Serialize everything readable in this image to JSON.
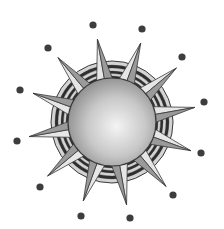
{
  "illustration": {
    "subject": "sun",
    "description": "Grayscale sun with shaded sphere, 12 triangular rays, concentric striped ring and 12 surrounding dots",
    "ray_count": 12,
    "dot_count": 12,
    "colors": {
      "background": "#ffffff",
      "sphere_highlight": "#f4f4f4",
      "sphere_mid": "#c8c8c8",
      "sphere_shadow": "#8a8a8a",
      "outline": "#3a3a3a",
      "ray_light": "#e6e6e6",
      "ray_dark": "#9a9a9a",
      "ring_light": "#d4d4d4",
      "ring_dark": "#2e2e2e",
      "dot": "#3d3d3d"
    }
  }
}
